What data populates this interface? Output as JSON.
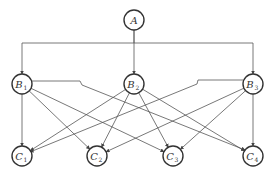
{
  "diagram": {
    "type": "hierarchy",
    "nodes": [
      {
        "id": "A",
        "label": "A",
        "sub": "",
        "x": 134,
        "y": 20
      },
      {
        "id": "B1",
        "label": "B",
        "sub": "1",
        "x": 22,
        "y": 84
      },
      {
        "id": "B2",
        "label": "B",
        "sub": "2",
        "x": 134,
        "y": 84
      },
      {
        "id": "B3",
        "label": "B",
        "sub": "3",
        "x": 253,
        "y": 84
      },
      {
        "id": "C1",
        "label": "C",
        "sub": "1",
        "x": 22,
        "y": 156
      },
      {
        "id": "C2",
        "label": "C",
        "sub": "2",
        "x": 97,
        "y": 156
      },
      {
        "id": "C3",
        "label": "C",
        "sub": "3",
        "x": 173,
        "y": 156
      },
      {
        "id": "C4",
        "label": "C",
        "sub": "4",
        "x": 253,
        "y": 156
      }
    ],
    "edges": [
      {
        "from": "A",
        "to": "B1"
      },
      {
        "from": "A",
        "to": "B2"
      },
      {
        "from": "A",
        "to": "B3"
      },
      {
        "from": "B1",
        "to": "C1"
      },
      {
        "from": "B1",
        "to": "C2"
      },
      {
        "from": "B1",
        "to": "C3"
      },
      {
        "from": "B1",
        "to": "C4"
      },
      {
        "from": "B2",
        "to": "C1"
      },
      {
        "from": "B2",
        "to": "C2"
      },
      {
        "from": "B2",
        "to": "C3"
      },
      {
        "from": "B2",
        "to": "C4"
      },
      {
        "from": "B3",
        "to": "C1"
      },
      {
        "from": "B3",
        "to": "C2"
      },
      {
        "from": "B3",
        "to": "C3"
      },
      {
        "from": "B3",
        "to": "C4"
      }
    ],
    "node_radius": 10,
    "bus_y": 43,
    "colors": {
      "stroke": "#333333",
      "edge": "#555555",
      "background": "#ffffff"
    }
  }
}
